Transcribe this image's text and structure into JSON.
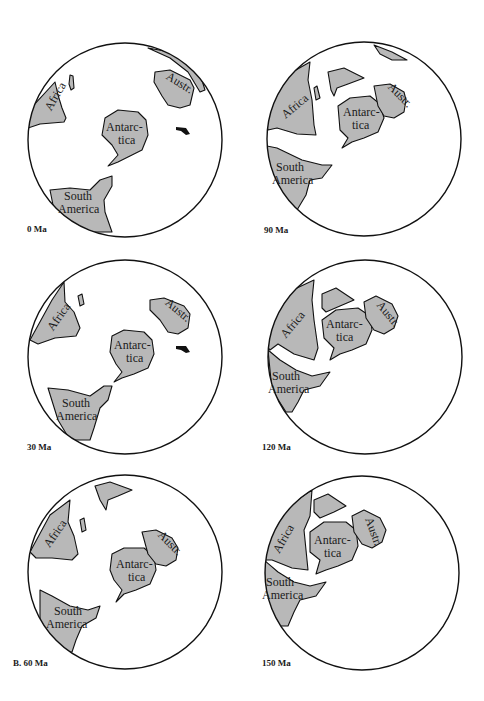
{
  "figure": {
    "part_label": "B.",
    "panels": [
      {
        "id": "p0",
        "age": "0 Ma",
        "labels": {
          "africa": "Africa",
          "antarctica_1": "Antarc-",
          "antarctica_2": "tica",
          "australia": "Austr.",
          "sa_1": "South",
          "sa_2": "America"
        }
      },
      {
        "id": "p90",
        "age": "90 Ma",
        "labels": {
          "africa": "Africa",
          "antarctica_1": "Antarc-",
          "antarctica_2": "tica",
          "australia": "Austr.",
          "sa_1": "South",
          "sa_2": "America"
        }
      },
      {
        "id": "p30",
        "age": "30 Ma",
        "labels": {
          "africa": "Africa",
          "antarctica_1": "Antarc-",
          "antarctica_2": "tica",
          "australia": "Austr.",
          "sa_1": "South",
          "sa_2": "America"
        }
      },
      {
        "id": "p120",
        "age": "120 Ma",
        "labels": {
          "africa": "Africa",
          "antarctica_1": "Antarc-",
          "antarctica_2": "tica",
          "australia": "Austr.",
          "sa_1": "South",
          "sa_2": "America"
        }
      },
      {
        "id": "p60",
        "age": "B. 60 Ma",
        "labels": {
          "africa": "Africa",
          "antarctica_1": "Antarc-",
          "antarctica_2": "tica",
          "australia": "Austr.",
          "sa_1": "South",
          "sa_2": "America"
        }
      },
      {
        "id": "p150",
        "age": "150 Ma",
        "labels": {
          "africa": "Africa",
          "antarctica_1": "Antarc-",
          "antarctica_2": "tica",
          "australia": "Austr.",
          "sa_1": "South",
          "sa_2": "America"
        }
      }
    ]
  },
  "colors": {
    "land": "#b8b8b8",
    "outline": "#111111",
    "ocean": "#ffffff"
  }
}
